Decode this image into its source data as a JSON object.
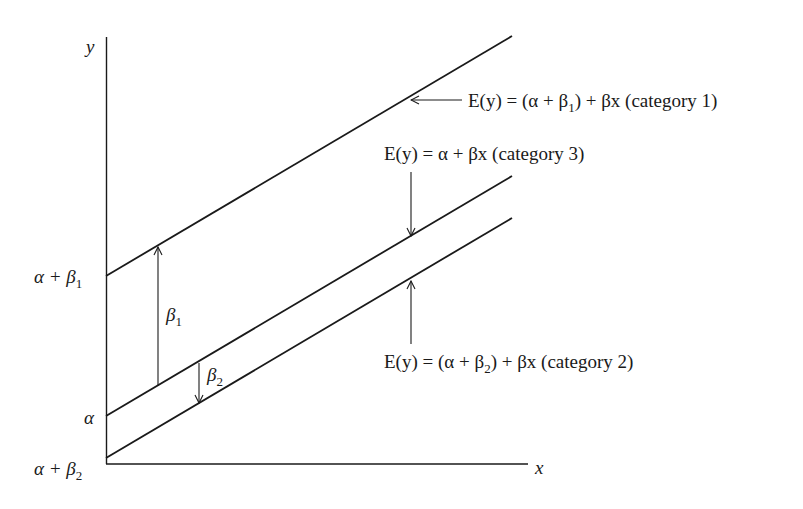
{
  "diagram": {
    "type": "regression-lines-with-dummy-variables",
    "axes": {
      "x_label": "x",
      "y_label": "y"
    },
    "intercept_labels": [
      {
        "id": "alpha_plus_beta1",
        "base": "α + β",
        "sub": "1"
      },
      {
        "id": "alpha",
        "base": "α",
        "sub": ""
      },
      {
        "id": "alpha_plus_beta2",
        "base": "α + β",
        "sub": "2"
      }
    ],
    "gap_labels": [
      {
        "id": "beta1",
        "base": "β",
        "sub": "1"
      },
      {
        "id": "beta2",
        "base": "β",
        "sub": "2"
      }
    ],
    "lines": [
      {
        "category": "category 1",
        "equation_pre": "E(y) = (α + β",
        "equation_sub": "1",
        "equation_post": ") + βx (category 1)",
        "intercept": "α + β1"
      },
      {
        "category": "category 3",
        "equation_pre": "E(y) = α + βx (category 3)",
        "equation_sub": "",
        "equation_post": "",
        "intercept": "α"
      },
      {
        "category": "category 2",
        "equation_pre": "E(y) = (α + β",
        "equation_sub": "2",
        "equation_post": ") + βx (category 2)",
        "intercept": "α + β2"
      }
    ],
    "colors": {
      "ink": "#1a1a1a",
      "background": "#ffffff"
    }
  }
}
